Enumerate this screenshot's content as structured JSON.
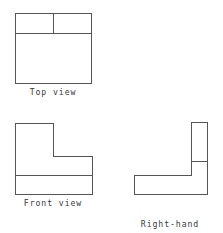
{
  "drawing": {
    "title": "Orthographic projection — three standard views",
    "background_color": "#ffffff",
    "line_color": "#555555",
    "line_width": 1,
    "canvas": {
      "width": 223,
      "height": 233
    }
  },
  "views": {
    "top": {
      "caption": "Top view",
      "shape": "rectangle",
      "outline": "M15,13 L91,13 L91,83 L15,83 Z",
      "interior_lines": [
        "M15,33 L91,33",
        "M53,13 L53,33"
      ]
    },
    "front": {
      "caption": "Front view",
      "shape": "l-shape",
      "outline": "M15,123 L53,123 L53,156 L92,156 L92,194 L15,194 Z",
      "interior_lines": [
        "M15,175 L92,175"
      ]
    },
    "side": {
      "caption_line1": "Right-hand",
      "caption_line2": "side view",
      "caption": "Right-hand side view",
      "shape": "l-shape-mirrored",
      "outline": "M191,122 L207,122 L207,194 L134,194 L134,175 L191,175 Z",
      "interior_lines": [
        "M191,161 L207,161"
      ]
    }
  }
}
